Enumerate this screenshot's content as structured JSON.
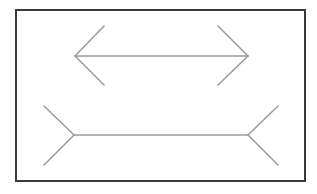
{
  "diagram": {
    "frame": {
      "x": 16,
      "y": 10,
      "width": 289,
      "height": 171,
      "stroke": "#3a3a3a",
      "stroke_width": 2
    },
    "line_color": "#9a9a9a",
    "figures": [
      {
        "name": "arrowheads-inward",
        "shaft": {
          "x1": 75,
          "y1": 56,
          "x2": 248,
          "y2": 56
        },
        "fins": [
          {
            "x1": 75,
            "y1": 56,
            "x2": 104,
            "y2": 26
          },
          {
            "x1": 75,
            "y1": 56,
            "x2": 104,
            "y2": 85
          },
          {
            "x1": 248,
            "y1": 56,
            "x2": 218,
            "y2": 26
          },
          {
            "x1": 248,
            "y1": 56,
            "x2": 218,
            "y2": 85
          }
        ]
      },
      {
        "name": "arrowheads-outward",
        "shaft": {
          "x1": 74,
          "y1": 135,
          "x2": 248,
          "y2": 135
        },
        "fins": [
          {
            "x1": 74,
            "y1": 135,
            "x2": 44,
            "y2": 106
          },
          {
            "x1": 74,
            "y1": 135,
            "x2": 44,
            "y2": 165
          },
          {
            "x1": 248,
            "y1": 135,
            "x2": 278,
            "y2": 106
          },
          {
            "x1": 248,
            "y1": 135,
            "x2": 278,
            "y2": 165
          }
        ]
      }
    ]
  }
}
